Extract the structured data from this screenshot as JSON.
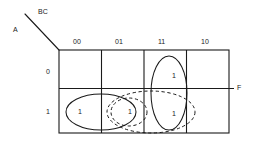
{
  "diagram": {
    "type": "karnaugh-map",
    "title_vars": {
      "row_var": "A",
      "col_var": "BC",
      "output_var": "F"
    },
    "column_headers": [
      "00",
      "01",
      "11",
      "10"
    ],
    "row_headers": [
      "0",
      "1"
    ],
    "cells": [
      {
        "row": "0",
        "col": "00",
        "value": ""
      },
      {
        "row": "0",
        "col": "01",
        "value": ""
      },
      {
        "row": "0",
        "col": "11",
        "value": "1"
      },
      {
        "row": "0",
        "col": "10",
        "value": ""
      },
      {
        "row": "1",
        "col": "00",
        "value": "1"
      },
      {
        "row": "1",
        "col": "01",
        "value": "1"
      },
      {
        "row": "1",
        "col": "11",
        "value": "1"
      },
      {
        "row": "1",
        "col": "10",
        "value": ""
      }
    ],
    "groupings": [
      {
        "name": "group-row1-00-01",
        "style": "solid",
        "shape": "ellipse-horizontal"
      },
      {
        "name": "group-cell-01-row1",
        "style": "dashed",
        "shape": "ellipse-small"
      },
      {
        "name": "group-row1-01-11",
        "style": "dashed",
        "shape": "ellipse-wide"
      },
      {
        "name": "group-col11-both-rows",
        "style": "solid",
        "shape": "ellipse-vertical"
      }
    ],
    "colors": {
      "ink": "#1a1a1a",
      "background": "#ffffff"
    }
  }
}
